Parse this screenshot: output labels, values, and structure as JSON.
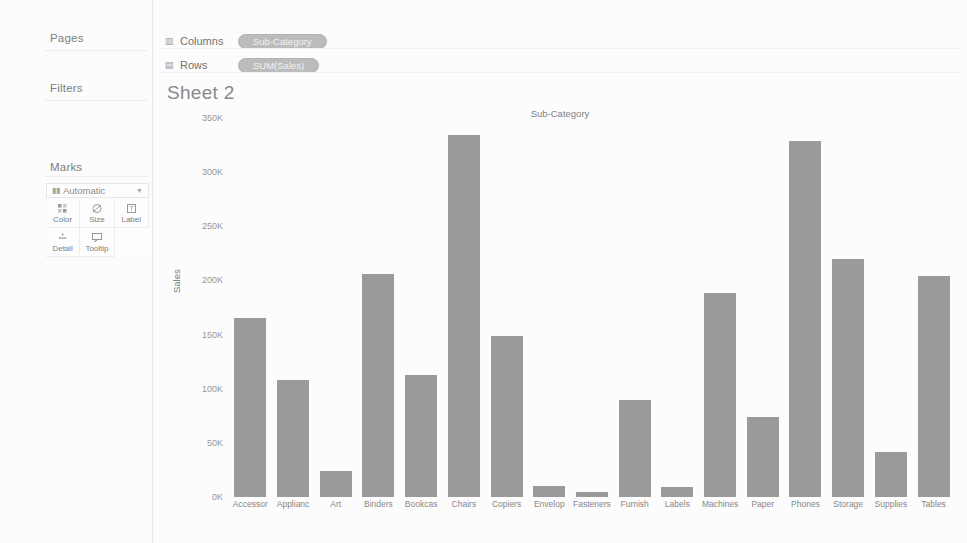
{
  "left_panel": {
    "pages_label": "Pages",
    "filters_label": "Filters",
    "marks_label": "Marks",
    "marks_type": "Automatic",
    "marks_buttons": [
      {
        "label": "Color",
        "icon": "color-squares-icon"
      },
      {
        "label": "Size",
        "icon": "size-circle-icon"
      },
      {
        "label": "Label",
        "icon": "label-box-icon"
      },
      {
        "label": "Detail",
        "icon": "detail-dots-icon"
      },
      {
        "label": "Tooltip",
        "icon": "tooltip-bubble-icon"
      }
    ]
  },
  "shelves": {
    "columns_label": "Columns",
    "columns_pill": "Sub-Category",
    "rows_label": "Rows",
    "rows_pill": "SUM(Sales)"
  },
  "sheet": {
    "title": "Sheet 2"
  },
  "chart_data": {
    "type": "bar",
    "title": "Sub-Category",
    "xlabel": "",
    "ylabel": "Sales",
    "ylim": [
      0,
      350000
    ],
    "ytick_labels": [
      "350K",
      "300K",
      "250K",
      "200K",
      "150K",
      "100K",
      "50K",
      "0K"
    ],
    "ytick_values": [
      350000,
      300000,
      250000,
      200000,
      150000,
      100000,
      50000,
      0
    ],
    "grid": false,
    "legend": "none",
    "categories": [
      "Accessor",
      "Applianc",
      "Art",
      "Binders",
      "Bookcas",
      "Chairs",
      "Copiers",
      "Envelop",
      "Fasteners",
      "Furnish",
      "Labels",
      "Machines",
      "Paper",
      "Phones",
      "Storage",
      "Supplies",
      "Tables"
    ],
    "values": [
      165000,
      108000,
      24000,
      206000,
      113000,
      334000,
      149000,
      10000,
      5000,
      90000,
      9000,
      188000,
      74000,
      329000,
      220000,
      42000,
      204000
    ],
    "bar_color": "#8e8e8e"
  }
}
